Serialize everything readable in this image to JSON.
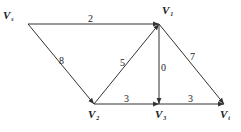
{
  "diagram": {
    "type": "directed-weighted-graph",
    "nodes": [
      {
        "id": "Vs",
        "main": "V",
        "sub": "s",
        "x": 28,
        "y": 24,
        "lx": 3,
        "ly": 19
      },
      {
        "id": "V1",
        "main": "V",
        "sub": "1",
        "x": 159,
        "y": 24,
        "lx": 162,
        "ly": 14
      },
      {
        "id": "V2",
        "main": "V",
        "sub": "2",
        "x": 94,
        "y": 104,
        "lx": 88,
        "ly": 118
      },
      {
        "id": "V3",
        "main": "V",
        "sub": "3",
        "x": 159,
        "y": 104,
        "lx": 155,
        "ly": 118
      },
      {
        "id": "Vt",
        "main": "V",
        "sub": "t",
        "x": 224,
        "y": 104,
        "lx": 220,
        "ly": 118
      }
    ],
    "edges": [
      {
        "from": "Vs",
        "to": "V1",
        "weight": "2",
        "lx": 88,
        "ly": 22
      },
      {
        "from": "Vs",
        "to": "V2",
        "weight": "8",
        "lx": 59,
        "ly": 64
      },
      {
        "from": "V2",
        "to": "V1",
        "weight": "5",
        "lx": 120,
        "ly": 66
      },
      {
        "from": "V1",
        "to": "V3",
        "weight": "0",
        "lx": 161,
        "ly": 71
      },
      {
        "from": "V1",
        "to": "Vt",
        "weight": "7",
        "lx": 190,
        "ly": 60
      },
      {
        "from": "V2",
        "to": "V3",
        "weight": "3",
        "lx": 124,
        "ly": 102
      },
      {
        "from": "V3",
        "to": "Vt",
        "weight": "3",
        "lx": 188,
        "ly": 102
      }
    ]
  }
}
